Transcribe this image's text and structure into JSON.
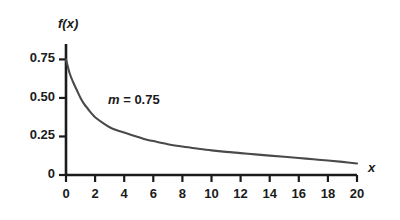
{
  "chart_data": {
    "type": "line",
    "title": "",
    "xlabel": "x",
    "ylabel": "f(x)",
    "xlim": [
      0,
      20
    ],
    "ylim": [
      0,
      0.85
    ],
    "grid": false,
    "legend": "none",
    "xticks": [
      "0",
      "2",
      "4",
      "6",
      "8",
      "10",
      "12",
      "14",
      "16",
      "18",
      "20"
    ],
    "xtick_values": [
      0,
      2,
      4,
      6,
      8,
      10,
      12,
      14,
      16,
      18,
      20
    ],
    "yticks": [
      "0",
      "0.25",
      "0.50",
      "0.75"
    ],
    "ytick_values": [
      0,
      0.25,
      0.5,
      0.75
    ],
    "annotations": [
      {
        "symbol": "m",
        "text": " = 0.75",
        "full_text": "m = 0.75",
        "x": 3.0,
        "y": 0.45
      }
    ],
    "series": [
      {
        "name": "f(x)",
        "color": "#4a4a4a",
        "x": [
          0,
          0.25,
          0.5,
          0.75,
          1,
          1.25,
          1.5,
          1.75,
          2,
          2.5,
          3,
          3.5,
          4,
          4.5,
          5,
          5.5,
          6,
          7,
          8,
          9,
          10,
          11,
          12,
          13,
          14,
          15,
          16,
          17,
          18,
          19,
          20
        ],
        "values": [
          0.75,
          0.66,
          0.6,
          0.55,
          0.5,
          0.46,
          0.43,
          0.4,
          0.375,
          0.34,
          0.31,
          0.29,
          0.275,
          0.26,
          0.245,
          0.23,
          0.22,
          0.2,
          0.185,
          0.172,
          0.16,
          0.15,
          0.142,
          0.134,
          0.126,
          0.118,
          0.11,
          0.102,
          0.094,
          0.085,
          0.075
        ]
      }
    ]
  },
  "axes": {
    "y_axis_name": "f(x)",
    "x_axis_name": "x"
  }
}
